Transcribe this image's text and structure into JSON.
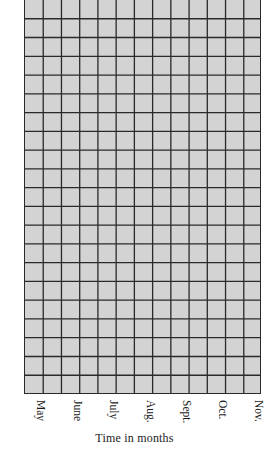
{
  "chart_data": {
    "type": "table",
    "title": "",
    "xlabel": "Time in months",
    "ylabel": "",
    "categories": [
      "May",
      "June",
      "July",
      "Aug.",
      "Sept.",
      "Oct.",
      "Nov."
    ],
    "grid": {
      "enabled": true,
      "columns": 13,
      "rows": 21,
      "fill_color": "#d3d3d3",
      "line_color": "#2a2a2a"
    },
    "series": [],
    "legend": null
  },
  "axis": {
    "x_title": "Time in months",
    "months": [
      {
        "label": "May",
        "x": 40
      },
      {
        "label": "June",
        "x": 77
      },
      {
        "label": "July",
        "x": 113
      },
      {
        "label": "Aug.",
        "x": 150
      },
      {
        "label": "Sept.",
        "x": 186
      },
      {
        "label": "Oct.",
        "x": 222
      },
      {
        "label": "Nov.",
        "x": 258
      }
    ]
  },
  "colors": {
    "grid_fill": "#d3d3d3",
    "grid_line": "#2a2a2a",
    "text": "#1a1a1a",
    "background": "#ffffff"
  }
}
